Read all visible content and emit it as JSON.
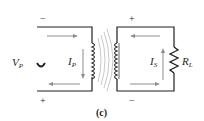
{
  "figure": {
    "caption": "(c)",
    "primary": {
      "voltage_label": "V",
      "voltage_sub": "P",
      "current_label": "I",
      "current_sub": "P",
      "top_sign": "−",
      "bottom_sign": "+"
    },
    "secondary": {
      "current_label": "I",
      "current_sub": "S",
      "load_label": "R",
      "load_sub": "L",
      "top_sign": "+",
      "bottom_sign": "−"
    },
    "colors": {
      "wire": "#231f20",
      "arrow": "#8c8c8c",
      "flux": "#b0b0b0"
    }
  }
}
